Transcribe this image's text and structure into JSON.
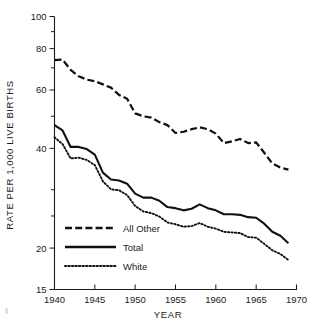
{
  "chart_data": {
    "type": "line",
    "title": "",
    "xlabel": "YEAR",
    "ylabel": "RATE PER 1,000 LIVE BIRTHS",
    "yscale": "log",
    "ylim": [
      15,
      100
    ],
    "xlim": [
      1940,
      1970
    ],
    "ytick_labels": [
      "100",
      "80",
      "60",
      "40",
      "20",
      "15"
    ],
    "ytick_values": [
      100,
      80,
      60,
      40,
      20,
      15
    ],
    "yminor_ticks": [
      90,
      70,
      50,
      30,
      25
    ],
    "xtick_labels": [
      "1940",
      "1945",
      "1950",
      "1955",
      "1960",
      "1965",
      "1970"
    ],
    "xtick_values": [
      1940,
      1945,
      1950,
      1955,
      1960,
      1965,
      1970
    ],
    "grid": false,
    "legend_position": "lower-left",
    "x": [
      1940,
      1941,
      1942,
      1943,
      1944,
      1945,
      1946,
      1947,
      1948,
      1949,
      1950,
      1951,
      1952,
      1953,
      1954,
      1955,
      1956,
      1957,
      1958,
      1959,
      1960,
      1961,
      1962,
      1963,
      1964,
      1965,
      1966,
      1967,
      1968,
      1969
    ],
    "series": [
      {
        "name": "All Other",
        "style": "dashed",
        "values": [
          73.8,
          74.1,
          69.0,
          66.0,
          64.5,
          63.8,
          62.4,
          61.0,
          58.0,
          56.5,
          51.0,
          50.0,
          49.5,
          48.0,
          47.0,
          44.5,
          44.9,
          45.7,
          46.3,
          45.7,
          44.3,
          41.5,
          42.0,
          42.7,
          41.5,
          41.7,
          38.8,
          36.0,
          35.0,
          34.5
        ],
        "dashes": "7 3.2"
      },
      {
        "name": "Total",
        "style": "solid",
        "values": [
          47.0,
          45.3,
          40.4,
          40.4,
          39.8,
          38.3,
          33.8,
          32.2,
          32.0,
          31.3,
          29.2,
          28.4,
          28.4,
          27.8,
          26.6,
          26.4,
          26.0,
          26.3,
          27.1,
          26.4,
          26.0,
          25.3,
          25.3,
          25.2,
          24.8,
          24.7,
          23.7,
          22.4,
          21.8,
          20.7
        ],
        "dashes": ""
      },
      {
        "name": "White",
        "style": "dotted",
        "values": [
          43.2,
          41.2,
          37.3,
          37.5,
          36.9,
          35.6,
          31.8,
          30.1,
          29.9,
          28.9,
          26.8,
          25.8,
          25.5,
          24.9,
          23.9,
          23.6,
          23.2,
          23.3,
          23.8,
          23.2,
          22.9,
          22.4,
          22.3,
          22.2,
          21.6,
          21.5,
          20.6,
          19.7,
          19.2,
          18.4
        ],
        "dashes": "1.4 2.1"
      }
    ],
    "legend": [
      {
        "label": "All Other",
        "style": "dashed"
      },
      {
        "label": "Total",
        "style": "solid"
      },
      {
        "label": "White",
        "style": "dotted"
      }
    ]
  }
}
